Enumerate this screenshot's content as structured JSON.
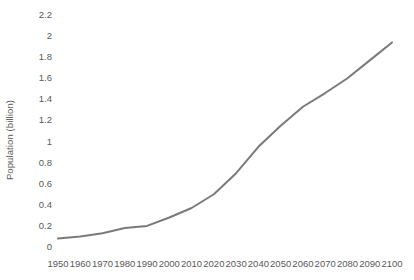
{
  "chart_data": {
    "type": "line",
    "title": "",
    "subtitle": "",
    "xlabel": "",
    "ylabel": "Population (billion)",
    "grid": false,
    "legend": false,
    "legend_position": "none",
    "line_color": "#7a7a7a",
    "line_width": 2,
    "background_color": "#ffffff",
    "text_color": "#595959",
    "xlim": [
      1950,
      2100
    ],
    "ylim": [
      0,
      2.2
    ],
    "x_tick_labels": [
      "1950",
      "1960",
      "1970",
      "1980",
      "1990",
      "2000",
      "2010",
      "2020",
      "2030",
      "2040",
      "2050",
      "2060",
      "2070",
      "2080",
      "2090",
      "2100"
    ],
    "y_tick_labels": [
      "2.2",
      "2",
      "1.8",
      "1.6",
      "1.4",
      "1.2",
      "1",
      "0.8",
      "0.6",
      "0.4",
      "0.2",
      "0"
    ],
    "y_ticks": [
      2.2,
      2,
      1.8,
      1.6,
      1.4,
      1.2,
      1,
      0.8,
      0.6,
      0.4,
      0.2,
      0
    ],
    "x": [
      1950,
      1960,
      1970,
      1980,
      1990,
      2000,
      2010,
      2020,
      2030,
      2040,
      2050,
      2060,
      2070,
      2080,
      2090,
      2100
    ],
    "series": [
      {
        "name": "Population",
        "values": [
          0.08,
          0.1,
          0.13,
          0.18,
          0.2,
          0.28,
          0.37,
          0.5,
          0.7,
          0.95,
          1.15,
          1.33,
          1.46,
          1.6,
          1.77,
          1.94
        ]
      }
    ]
  }
}
